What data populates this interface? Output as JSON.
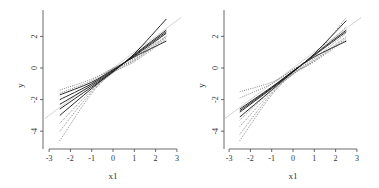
{
  "chart_data": [
    {
      "type": "line",
      "panel": "left",
      "title": "",
      "xlabel": "x1",
      "ylabel": "y",
      "xlim": [
        -3.2,
        3.2
      ],
      "ylim": [
        -5,
        3.8
      ],
      "xticks": [
        -3,
        -2,
        -1,
        0,
        1,
        2,
        3
      ],
      "xtick_labels": [
        "-3",
        "-2",
        "-1",
        "0",
        "1",
        "2",
        "3"
      ],
      "yticks": [
        -4,
        -2,
        0,
        2
      ],
      "ytick_labels": [
        "-4",
        "-2",
        "0",
        "2"
      ],
      "grid": false,
      "legend": null,
      "reference_line": {
        "style": "solid-light-gray",
        "x": [
          -3.2,
          3.2
        ],
        "y": [
          -3.2,
          3.2
        ]
      },
      "series": [
        {
          "name": "solid-1",
          "style": "solid",
          "x": [
            -2.5,
            -1,
            0,
            1,
            2.5
          ],
          "y": [
            -1.7,
            -0.9,
            -0.1,
            0.7,
            1.7
          ]
        },
        {
          "name": "solid-2",
          "style": "solid",
          "x": [
            -2.5,
            -1,
            0,
            1,
            2.5
          ],
          "y": [
            -2.0,
            -1.0,
            -0.15,
            0.75,
            2.2
          ]
        },
        {
          "name": "solid-3",
          "style": "solid",
          "x": [
            -2.5,
            -1,
            0,
            1,
            2.5
          ],
          "y": [
            -2.3,
            -1.1,
            -0.2,
            0.8,
            2.3
          ]
        },
        {
          "name": "solid-4",
          "style": "solid",
          "x": [
            -2.5,
            -1,
            0,
            1,
            2.5
          ],
          "y": [
            -2.6,
            -1.2,
            -0.25,
            0.85,
            2.4
          ]
        },
        {
          "name": "solid-5",
          "style": "solid",
          "x": [
            -2.5,
            -1,
            0,
            1,
            2.5
          ],
          "y": [
            -3.0,
            -1.3,
            -0.2,
            0.9,
            3.1
          ]
        },
        {
          "name": "dotted-1",
          "style": "dotted",
          "x": [
            -2.5,
            -1,
            0,
            1,
            2.5
          ],
          "y": [
            -1.4,
            -0.7,
            0.0,
            0.7,
            2.0
          ]
        },
        {
          "name": "dotted-2",
          "style": "dotted",
          "x": [
            -2.5,
            -1,
            0,
            1,
            2.5
          ],
          "y": [
            -1.6,
            -0.8,
            -0.05,
            0.5,
            1.9
          ]
        },
        {
          "name": "dotted-3",
          "style": "dotted",
          "x": [
            -2.5,
            -1,
            0,
            1,
            2.5
          ],
          "y": [
            -3.5,
            -1.4,
            -0.2,
            0.6,
            2.2
          ]
        },
        {
          "name": "dotted-4",
          "style": "dotted",
          "x": [
            -2.5,
            -1,
            0,
            1,
            2.5
          ],
          "y": [
            -4.0,
            -1.5,
            -0.3,
            0.5,
            2.0
          ]
        },
        {
          "name": "dotted-5",
          "style": "dotted",
          "x": [
            -2.5,
            -1,
            0,
            1,
            2.5
          ],
          "y": [
            -4.6,
            -1.6,
            -0.3,
            0.4,
            1.8
          ]
        }
      ]
    },
    {
      "type": "line",
      "panel": "right",
      "title": "",
      "xlabel": "x1",
      "ylabel": "y",
      "xlim": [
        -3.2,
        3.2
      ],
      "ylim": [
        -5,
        3.8
      ],
      "xticks": [
        -3,
        -2,
        -1,
        0,
        1,
        2,
        3
      ],
      "xtick_labels": [
        "-3",
        "-2",
        "-1",
        "0",
        "1",
        "2",
        "3"
      ],
      "yticks": [
        -4,
        -2,
        0,
        2
      ],
      "ytick_labels": [
        "-4",
        "-2",
        "0",
        "2"
      ],
      "grid": false,
      "legend": null,
      "reference_line": {
        "style": "solid-light-gray",
        "x": [
          -3.2,
          3.2
        ],
        "y": [
          -3.2,
          3.2
        ]
      },
      "series": [
        {
          "name": "solid-1",
          "style": "solid",
          "x": [
            -2.5,
            -1,
            0,
            1,
            2.5
          ],
          "y": [
            -2.6,
            -1.2,
            -0.2,
            0.7,
            1.7
          ]
        },
        {
          "name": "solid-2",
          "style": "solid",
          "x": [
            -2.5,
            -1,
            0,
            1,
            2.5
          ],
          "y": [
            -2.7,
            -1.25,
            -0.2,
            0.8,
            2.3
          ]
        },
        {
          "name": "solid-3",
          "style": "solid",
          "x": [
            -2.5,
            -1,
            0,
            1,
            2.5
          ],
          "y": [
            -2.8,
            -1.3,
            -0.25,
            0.85,
            2.4
          ]
        },
        {
          "name": "solid-4",
          "style": "solid",
          "x": [
            -2.5,
            -1,
            0,
            1,
            2.5
          ],
          "y": [
            -3.1,
            -1.4,
            -0.25,
            0.9,
            3.0
          ]
        },
        {
          "name": "dotted-1",
          "style": "dotted",
          "x": [
            -2.5,
            -1,
            0,
            1,
            2.5
          ],
          "y": [
            -1.5,
            -0.9,
            -0.1,
            0.8,
            2.6
          ]
        },
        {
          "name": "dotted-2",
          "style": "dotted",
          "x": [
            -2.5,
            -1,
            0,
            1,
            2.5
          ],
          "y": [
            -1.9,
            -1.0,
            -0.1,
            0.75,
            3.2
          ]
        },
        {
          "name": "dotted-3",
          "style": "dotted",
          "x": [
            -2.5,
            -1,
            0,
            1,
            2.5
          ],
          "y": [
            -3.3,
            -1.4,
            -0.3,
            0.6,
            2.2
          ]
        },
        {
          "name": "dotted-4",
          "style": "dotted",
          "x": [
            -2.5,
            -1,
            0,
            1,
            2.5
          ],
          "y": [
            -3.7,
            -1.5,
            -0.35,
            0.5,
            2.0
          ]
        },
        {
          "name": "dotted-5",
          "style": "dotted",
          "x": [
            -2.5,
            -1,
            0,
            1,
            2.5
          ],
          "y": [
            -4.2,
            -1.6,
            -0.4,
            0.45,
            1.9
          ]
        },
        {
          "name": "dotted-6",
          "style": "dotted",
          "x": [
            -2.5,
            -1,
            0,
            1,
            2.5
          ],
          "y": [
            -4.6,
            -1.7,
            -0.4,
            0.4,
            1.8
          ]
        }
      ]
    }
  ],
  "colors": {
    "axis": "#444444",
    "solid_line": "#111111",
    "dotted_line": "#555555",
    "reference_line": "#c8c8c8",
    "background": "#ffffff"
  },
  "layout": {
    "panels": [
      {
        "axis_x": 43,
        "axis_y": 149,
        "x0px": 113,
        "xscale": 21.3,
        "y0px": 68,
        "yscale": 15.8,
        "top": 10,
        "right": 182
      },
      {
        "axis_x": 224,
        "axis_y": 149,
        "x0px": 293,
        "xscale": 21.3,
        "y0px": 68,
        "yscale": 15.8,
        "top": 10,
        "right": 362
      }
    ]
  }
}
